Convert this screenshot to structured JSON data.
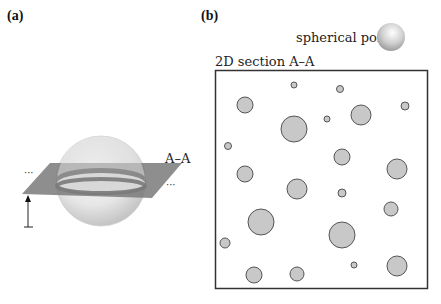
{
  "panels": {
    "a": {
      "label": "(a)",
      "plane_label": "A–A",
      "ellipsis_left": "···",
      "ellipsis_right": "···"
    },
    "b": {
      "label": "(b)",
      "legend_label": "spherical pore",
      "section_title": "2D section A–A",
      "box": {
        "x": 215,
        "y": 70,
        "w": 212,
        "h": 219
      },
      "pores": [
        {
          "cx": 294,
          "cy": 85,
          "r": 3
        },
        {
          "cx": 340,
          "cy": 89,
          "r": 3.5
        },
        {
          "cx": 245,
          "cy": 105,
          "r": 8
        },
        {
          "cx": 405,
          "cy": 106,
          "r": 4
        },
        {
          "cx": 361,
          "cy": 115,
          "r": 10
        },
        {
          "cx": 327,
          "cy": 119,
          "r": 3
        },
        {
          "cx": 294,
          "cy": 129,
          "r": 13
        },
        {
          "cx": 228,
          "cy": 146,
          "r": 3.5
        },
        {
          "cx": 342,
          "cy": 157,
          "r": 8
        },
        {
          "cx": 397,
          "cy": 169,
          "r": 10
        },
        {
          "cx": 245,
          "cy": 174,
          "r": 8
        },
        {
          "cx": 297,
          "cy": 189,
          "r": 10
        },
        {
          "cx": 342,
          "cy": 193,
          "r": 4
        },
        {
          "cx": 391,
          "cy": 209,
          "r": 7
        },
        {
          "cx": 261,
          "cy": 222,
          "r": 13
        },
        {
          "cx": 342,
          "cy": 235,
          "r": 13
        },
        {
          "cx": 225,
          "cy": 243,
          "r": 5
        },
        {
          "cx": 354,
          "cy": 265,
          "r": 3
        },
        {
          "cx": 397,
          "cy": 266,
          "r": 10
        },
        {
          "cx": 254,
          "cy": 275,
          "r": 8
        },
        {
          "cx": 297,
          "cy": 274,
          "r": 7
        }
      ]
    }
  },
  "colors": {
    "pore_fill": "#c8c8c8",
    "pore_stroke": "#555555",
    "plane": "#7a7a7a",
    "box_stroke": "#333333"
  }
}
